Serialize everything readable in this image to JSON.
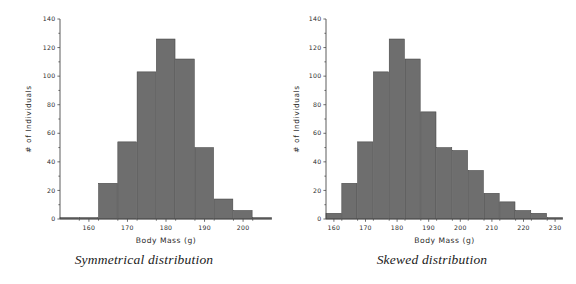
{
  "figure": {
    "background_color": "#ffffff",
    "bar_color": "#6e6e6e",
    "bar_edge_color": "#3d3d3d",
    "axis_color": "#4a4a4a",
    "text_color": "#2b2b2b"
  },
  "panels": [
    {
      "caption": "Symmetrical distribution",
      "chart": {
        "type": "bar",
        "title": "",
        "xlabel": "Body Mass (g)",
        "ylabel": "# of Individuals",
        "xlim": [
          152.5,
          207.5
        ],
        "ylim": [
          0,
          140
        ],
        "xticks": [
          160,
          170,
          180,
          190,
          200
        ],
        "yticks": [
          0,
          20,
          40,
          60,
          80,
          100,
          120,
          140
        ],
        "xtick_labels": [
          "160",
          "170",
          "180",
          "190",
          "200"
        ],
        "ytick_labels": [
          "0",
          "20",
          "40",
          "60",
          "80",
          "100",
          "120",
          "140"
        ],
        "grid": false,
        "legend": "none",
        "bin_width": 5,
        "bin_starts": [
          152.5,
          157.5,
          162.5,
          167.5,
          172.5,
          177.5,
          182.5,
          187.5,
          192.5,
          197.5,
          202.5
        ],
        "bin_centers": [
          155,
          160,
          165,
          170,
          175,
          180,
          185,
          190,
          195,
          200,
          205
        ],
        "values": [
          1,
          1,
          25,
          54,
          103,
          126,
          112,
          50,
          14,
          6,
          1
        ]
      }
    },
    {
      "caption": "Skewed distribution",
      "chart": {
        "type": "bar",
        "title": "",
        "xlabel": "Body Mass (g)",
        "ylabel": "# of Individuals",
        "xlim": [
          157.5,
          232.5
        ],
        "ylim": [
          0,
          140
        ],
        "xticks": [
          160,
          170,
          180,
          190,
          200,
          210,
          220,
          230
        ],
        "yticks": [
          0,
          20,
          40,
          60,
          80,
          100,
          120,
          140
        ],
        "xtick_labels": [
          "160",
          "170",
          "180",
          "190",
          "200",
          "210",
          "220",
          "230"
        ],
        "ytick_labels": [
          "0",
          "20",
          "40",
          "60",
          "80",
          "100",
          "120",
          "140"
        ],
        "grid": false,
        "legend": "none",
        "bin_width": 5,
        "bin_starts": [
          157.5,
          162.5,
          167.5,
          172.5,
          177.5,
          182.5,
          187.5,
          192.5,
          197.5,
          202.5,
          207.5,
          212.5,
          217.5,
          222.5,
          227.5
        ],
        "bin_centers": [
          160,
          165,
          170,
          175,
          180,
          185,
          190,
          195,
          200,
          205,
          210,
          215,
          220,
          225,
          230
        ],
        "values": [
          4,
          25,
          54,
          103,
          126,
          112,
          75,
          50,
          48,
          34,
          18,
          12,
          6,
          4,
          1
        ]
      }
    }
  ],
  "chart_data": [
    {
      "type": "bar",
      "title": "Symmetrical distribution",
      "xlabel": "Body Mass (g)",
      "ylabel": "# of Individuals",
      "categories": [
        "155",
        "160",
        "165",
        "170",
        "175",
        "180",
        "185",
        "190",
        "195",
        "200",
        "205"
      ],
      "values": [
        1,
        1,
        25,
        54,
        103,
        126,
        112,
        50,
        14,
        6,
        1
      ],
      "xlim": [
        152.5,
        207.5
      ],
      "ylim": [
        0,
        140
      ],
      "xticks": [
        160,
        170,
        180,
        190,
        200
      ],
      "yticks": [
        0,
        20,
        40,
        60,
        80,
        100,
        120,
        140
      ],
      "grid": false,
      "legend": "none"
    },
    {
      "type": "bar",
      "title": "Skewed distribution",
      "xlabel": "Body Mass (g)",
      "ylabel": "# of Individuals",
      "categories": [
        "160",
        "165",
        "170",
        "175",
        "180",
        "185",
        "190",
        "195",
        "200",
        "205",
        "210",
        "215",
        "220",
        "225",
        "230"
      ],
      "values": [
        4,
        25,
        54,
        103,
        126,
        112,
        75,
        50,
        48,
        34,
        18,
        12,
        6,
        4,
        1
      ],
      "xlim": [
        157.5,
        232.5
      ],
      "ylim": [
        0,
        140
      ],
      "xticks": [
        160,
        170,
        180,
        190,
        200,
        210,
        220,
        230
      ],
      "yticks": [
        0,
        20,
        40,
        60,
        80,
        100,
        120,
        140
      ],
      "grid": false,
      "legend": "none"
    }
  ]
}
